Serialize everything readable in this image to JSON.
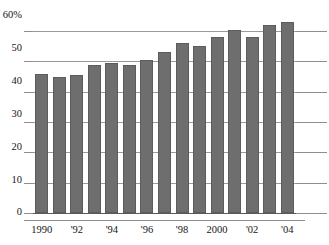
{
  "chart_data": {
    "type": "bar",
    "title": "",
    "xlabel": "",
    "ylabel": "",
    "ylim": [
      0,
      65
    ],
    "yticks": [
      0,
      10,
      20,
      30,
      40,
      50,
      60
    ],
    "ytick_labels": [
      "0",
      "10",
      "20",
      "30",
      "40",
      "50",
      "60%"
    ],
    "grid": true,
    "legend": "none",
    "bar_color": "#6e6e6e",
    "categories": [
      "1990",
      "1991",
      "1992",
      "1993",
      "1994",
      "1995",
      "1996",
      "1997",
      "1998",
      "1999",
      "2000",
      "2001",
      "2002",
      "2003",
      "2004"
    ],
    "xtick_labels": [
      "1990",
      "",
      "'92",
      "",
      "'94",
      "",
      "'96",
      "",
      "'98",
      "",
      "2000",
      "",
      "'02",
      "",
      "'04"
    ],
    "values": [
      46,
      45,
      45.5,
      49,
      49.5,
      49,
      50.5,
      53,
      56,
      55,
      58,
      60.5,
      58,
      62,
      63
    ]
  },
  "axis": {
    "y_unit_suffix": "%",
    "y_labels": [
      "60%",
      "50",
      "40",
      "30",
      "20",
      "10",
      "0"
    ],
    "x_labels": [
      "1990",
      "'92",
      "'94",
      "'96",
      "'98",
      "2000",
      "'02",
      "'04"
    ]
  },
  "header": {
    "cropped_title": ""
  }
}
